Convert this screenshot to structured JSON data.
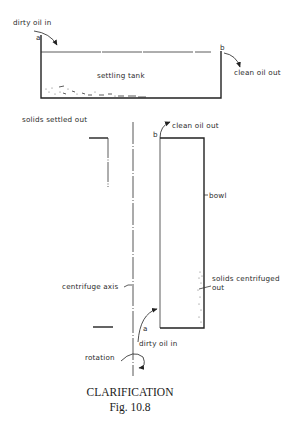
{
  "settling_tank": {
    "inlet_label": "dirty oil in",
    "inlet_point": "a",
    "outlet_point": "b",
    "outlet_label": "clean oil out",
    "tank_label": "settling tank"
  },
  "centrifuge": {
    "solids_label": "solids settled out",
    "outlet_point": "b",
    "outlet_label": "clean oil out",
    "bowl_label": "bowl",
    "solids_centrifuged_line1": "solids centrifuged",
    "solids_centrifuged_line2": "out",
    "axis_label": "centrifuge axis",
    "inlet_point": "a",
    "inlet_label": "dirty oil in",
    "rotation_label": "rotation"
  },
  "caption": {
    "title": "CLARIFICATION",
    "figure": "Fig. 10.8"
  },
  "colors": {
    "line": "#222222",
    "background": "#ffffff"
  }
}
